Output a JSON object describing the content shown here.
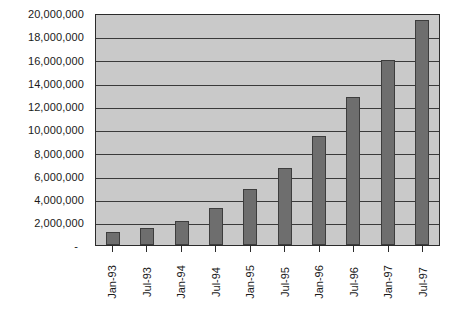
{
  "chart_data": {
    "type": "bar",
    "title": "",
    "subtitle": "",
    "xlabel": "",
    "ylabel": "",
    "categories": [
      "Jan-93",
      "Jul-93",
      "Jan-94",
      "Jul-94",
      "Jan-95",
      "Jul-95",
      "Jan-96",
      "Jul-96",
      "Jan-97",
      "Jul-97"
    ],
    "values": [
      1100000,
      1500000,
      2100000,
      3200000,
      4900000,
      6700000,
      9500000,
      12900000,
      16100000,
      19600000
    ],
    "ylim": [
      0,
      20000000
    ],
    "ytick_values": [
      0,
      2000000,
      4000000,
      6000000,
      8000000,
      10000000,
      12000000,
      14000000,
      16000000,
      18000000,
      20000000
    ],
    "ytick_labels": [
      "-",
      "2,000,000",
      "4,000,000",
      "6,000,000",
      "8,000,000",
      "10,000,000",
      "12,000,000",
      "14,000,000",
      "16,000,000",
      "18,000,000",
      "20,000,000"
    ],
    "grid": true,
    "legend": false,
    "legend_position": "none",
    "colors": {
      "bar_fill": "#6e6e6e",
      "bar_border": "#3d3d3d",
      "plot_background": "#c9c9c9",
      "gridline": "#3a3a3a",
      "axis_line": "#2b2b2b",
      "text": "#1a1a1a",
      "page_background": "#ffffff"
    }
  }
}
